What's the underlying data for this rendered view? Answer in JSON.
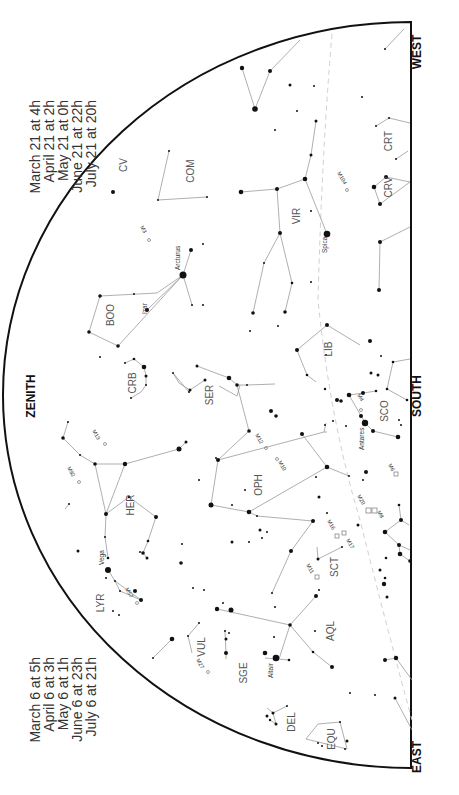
{
  "chart": {
    "directions": {
      "zenith": "ZENITH",
      "south": "SOUTH",
      "east": "EAST",
      "west": "WEST"
    },
    "times_left": [
      "March 6 at   5h",
      "April 6 at   3h",
      "May 6 at   1h",
      "June 6 at 23h",
      "July 6 at 21h"
    ],
    "times_right": [
      "March 21 at   4h",
      "April 21 at   2h",
      "May 21 at   0h",
      "June 21 at 22h",
      "July 21 at 20h"
    ],
    "constellations": {
      "com": "COM",
      "crt": "CRT",
      "crv": "CRV",
      "vir": "VIR",
      "boo": "BOO",
      "crb": "CRB",
      "ser": "SER",
      "lib": "LIB",
      "sco": "SCO",
      "oph": "OPH",
      "her": "HER",
      "sct": "SCT",
      "aql": "AQL",
      "sge": "SGE",
      "vul": "VUL",
      "del": "DEL",
      "equ": "EQU",
      "lyr": "LYR",
      "cvn": "CV"
    },
    "stars": {
      "arcturus": "Arcturus",
      "spica": "Spica",
      "antares": "Antares",
      "vega": "Vega",
      "altair": "Altair",
      "izar": "Izar"
    },
    "objects": {
      "m104": "M104",
      "m3": "M3",
      "m13": "M13",
      "m92": "M92",
      "m12": "M12",
      "m10": "M10",
      "m4": "M4",
      "m6": "M6",
      "m8": "M8",
      "m20": "M20",
      "m16": "M16",
      "m17": "M17",
      "m11": "M11",
      "m57": "M57",
      "m27": "M27"
    },
    "colors": {
      "horizon": "#111111",
      "lines": "#9a9a9a",
      "ecliptic": "#cfcfcf",
      "text": "#333333"
    }
  }
}
